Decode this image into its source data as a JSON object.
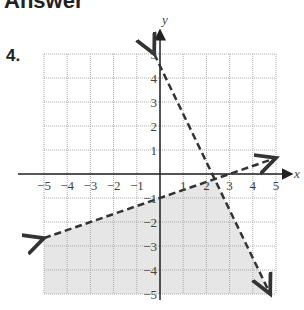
{
  "header": {
    "title": "Answer",
    "problem_number": "4."
  },
  "chart_data": {
    "type": "line",
    "title": "",
    "xlabel": "x",
    "ylabel": "y",
    "xlim": [
      -5,
      5
    ],
    "ylim": [
      -5,
      5
    ],
    "grid": true,
    "x_ticks": [
      "-5",
      "-4",
      "-3",
      "-2",
      "-1",
      "1",
      "2",
      "3",
      "4",
      "5"
    ],
    "y_ticks": [
      "5",
      "4",
      "3",
      "2",
      "1",
      "-1",
      "-2",
      "-3",
      "-4",
      "-5"
    ],
    "series": [
      {
        "name": "boundary 1 (dashed)",
        "equation": "y = -2x + 4.5",
        "points": [
          [
            -0.25,
            5
          ],
          [
            4.75,
            -5
          ]
        ],
        "style": "dashed"
      },
      {
        "name": "boundary 2 (dashed)",
        "equation": "y = x/3 - 1",
        "points": [
          [
            -5,
            -2.67
          ],
          [
            5,
            0.67
          ]
        ],
        "style": "dashed"
      }
    ],
    "shaded_region": "below both lines (y < x/3 - 1 and y < -2x + 4.5)",
    "shade_color": "#e6e6e6"
  }
}
